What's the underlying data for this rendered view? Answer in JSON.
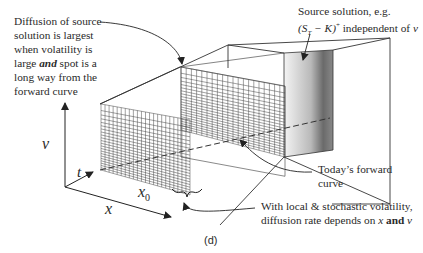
{
  "figure": {
    "caption": "(d)",
    "annotations": {
      "diffusion_largest": [
        "Diffusion of source",
        "solution is largest",
        "when volatility is",
        "large ",
        "and",
        " spot is a",
        "long way from the",
        "forward curve"
      ],
      "source_solution": {
        "line1": "Source solution, e.g.",
        "line2_math": "(S",
        "line2_sub": "T",
        "line2_rest": " − K)",
        "line2_sup": "+",
        "line2_tail": " independent of ",
        "line2_var": "v"
      },
      "forward_curve": [
        "Today’s forward",
        "curve"
      ],
      "local_stochastic": {
        "line1": "With local & stochastic volatility,",
        "line2_pre": "diffusion rate depends on ",
        "line2_x": "x",
        "line2_and": " and ",
        "line2_v": "v"
      }
    },
    "axes": {
      "v": "v",
      "t": "t",
      "x": "x",
      "x0_base": "x",
      "x0_sub": "0"
    }
  }
}
